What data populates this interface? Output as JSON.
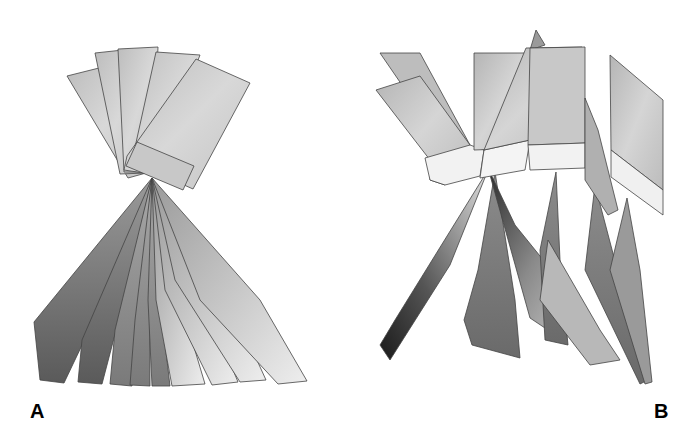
{
  "figure": {
    "panels": [
      {
        "label": "A",
        "description": "Fanned rectangular blades above, tapered blades radiating below from a common pivot"
      },
      {
        "label": "B",
        "description": "Dispersed rectangular blades above with light base strips, tapered blades hanging below"
      }
    ]
  }
}
